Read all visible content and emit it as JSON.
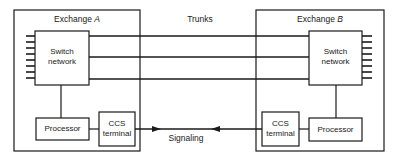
{
  "diagram": {
    "type": "block-diagram",
    "colors": {
      "background": "#ffffff",
      "line": "#1a1a1a"
    },
    "exchange_a": {
      "label_prefix": "Exchange",
      "label_letter": "A",
      "switch_network": {
        "line1": "Switch",
        "line2": "network"
      },
      "processor": {
        "label": "Processor"
      },
      "ccs_terminal": {
        "line1": "CCS",
        "line2": "terminal"
      },
      "line_ticks": 8
    },
    "exchange_b": {
      "label_prefix": "Exchange",
      "label_letter": "B",
      "switch_network": {
        "line1": "Switch",
        "line2": "network"
      },
      "processor": {
        "label": "Processor"
      },
      "ccs_terminal": {
        "line1": "CCS",
        "line2": "terminal"
      },
      "line_ticks": 8
    },
    "trunks": {
      "label": "Trunks",
      "count": 3
    },
    "signaling": {
      "label": "Signaling",
      "direction": "bidirectional"
    }
  }
}
